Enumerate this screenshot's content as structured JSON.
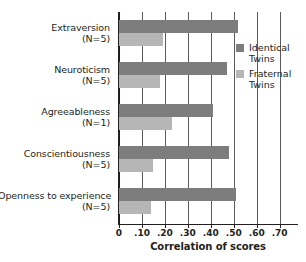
{
  "chart_data": {
    "type": "bar",
    "orientation": "horizontal",
    "title": "",
    "xlabel": "Correlation of scores",
    "ylabel": "",
    "xlim": [
      0,
      0.78
    ],
    "grid": true,
    "legend_position": "right",
    "categories": [
      "Extraversion",
      "Neuroticism",
      "Agreeableness",
      "Conscientiousness",
      "Openness to experience"
    ],
    "category_sublabels": [
      "(N=5)",
      "(N=5)",
      "(N=1)",
      "(N=5)",
      "(N=5)"
    ],
    "xticks": [
      0,
      0.1,
      0.2,
      0.3,
      0.4,
      0.5,
      0.6,
      0.7
    ],
    "xtick_labels": [
      "0",
      ".10",
      ".20",
      ".30",
      ".40",
      ".50",
      ".60",
      ".70"
    ],
    "series": [
      {
        "name": "Identical Twins",
        "color": "#7d7d7d",
        "values": [
          0.52,
          0.47,
          0.41,
          0.48,
          0.51
        ]
      },
      {
        "name": "Fraternal Twins",
        "color": "#b6b6b6",
        "values": [
          0.19,
          0.18,
          0.23,
          0.15,
          0.14
        ]
      }
    ]
  },
  "legend": {
    "items": [
      {
        "line1": "Identical",
        "line2": "Twins",
        "key": "identical"
      },
      {
        "line1": "Fraternal",
        "line2": "Twins",
        "key": "fraternal"
      }
    ]
  },
  "axis": {
    "x_title": "Correlation of scores"
  }
}
